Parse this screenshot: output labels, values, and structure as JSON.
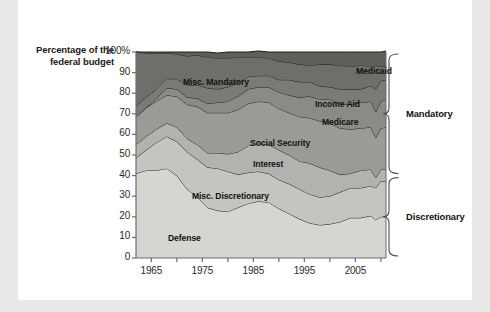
{
  "chart_data": {
    "type": "area",
    "title": "",
    "xlabel": "",
    "ylabel": "Percentage of the federal budget",
    "ylabel_line1": "Percentage of the",
    "ylabel_line2": "federal budget",
    "xlim": [
      1962,
      2011
    ],
    "ylim": [
      0,
      100
    ],
    "grid": false,
    "stacked": true,
    "legend_position": "inline-labels",
    "y_ticks": [
      "0",
      "10",
      "20",
      "30",
      "40",
      "50",
      "60",
      "70",
      "80",
      "90",
      "100%"
    ],
    "y_tick_values": [
      0,
      10,
      20,
      30,
      40,
      50,
      60,
      70,
      80,
      90,
      100
    ],
    "x_ticks": [
      "1965",
      "1975",
      "1985",
      "1995",
      "2005"
    ],
    "x_tick_values": [
      1965,
      1975,
      1985,
      1995,
      2005
    ],
    "x": [
      1962,
      1964,
      1966,
      1968,
      1970,
      1972,
      1974,
      1976,
      1978,
      1980,
      1982,
      1984,
      1986,
      1988,
      1990,
      1992,
      1994,
      1996,
      1998,
      2000,
      2002,
      2004,
      2006,
      2008,
      2009,
      2010,
      2011
    ],
    "series": [
      {
        "name": "Defense",
        "color": "#d5d5d2",
        "values": [
          41.0,
          42.5,
          42.5,
          43.5,
          40.0,
          33.5,
          29.5,
          24.5,
          23.0,
          22.5,
          24.5,
          26.5,
          27.5,
          27.0,
          24.0,
          21.5,
          19.0,
          17.0,
          16.0,
          16.5,
          17.5,
          19.5,
          19.5,
          20.5,
          18.5,
          20.0,
          20.0
        ]
      },
      {
        "name": "Misc. Discretionary",
        "color": "#c4c4c0",
        "values": [
          7.5,
          10.0,
          13.5,
          15.5,
          16.5,
          18.0,
          18.5,
          19.5,
          20.5,
          19.5,
          16.0,
          15.0,
          14.5,
          14.0,
          14.0,
          14.5,
          14.5,
          14.0,
          13.5,
          13.5,
          14.5,
          14.5,
          14.5,
          14.5,
          15.5,
          17.5,
          17.0
        ]
      },
      {
        "name": "Interest",
        "color": "#b2b2ae",
        "values": [
          6.5,
          6.5,
          6.5,
          6.5,
          7.0,
          6.5,
          7.0,
          7.0,
          7.5,
          8.5,
          11.0,
          13.0,
          13.5,
          14.0,
          14.5,
          14.0,
          13.5,
          15.0,
          14.5,
          12.5,
          8.5,
          7.0,
          8.5,
          8.0,
          5.0,
          5.5,
          6.0
        ]
      },
      {
        "name": "Social Security",
        "color": "#9a9a96",
        "values": [
          13.5,
          14.0,
          13.5,
          13.5,
          15.0,
          16.5,
          18.5,
          19.5,
          19.5,
          20.0,
          20.5,
          20.5,
          20.5,
          20.5,
          20.0,
          20.5,
          21.5,
          22.0,
          22.5,
          23.0,
          22.5,
          21.5,
          20.5,
          20.5,
          19.5,
          20.0,
          20.5
        ]
      },
      {
        "name": "Medicare",
        "color": "#8a8a86",
        "values": [
          0.0,
          0.0,
          1.5,
          3.5,
          3.5,
          3.5,
          4.0,
          4.5,
          5.0,
          5.5,
          6.5,
          7.0,
          7.0,
          7.5,
          8.0,
          8.5,
          9.5,
          10.5,
          10.5,
          11.5,
          12.0,
          12.0,
          12.5,
          12.5,
          12.5,
          13.0,
          13.5
        ]
      },
      {
        "name": "Income Aid",
        "color": "#7a7a76",
        "values": [
          5.5,
          5.0,
          4.5,
          4.5,
          5.0,
          6.0,
          6.5,
          7.5,
          6.5,
          7.0,
          6.5,
          6.0,
          5.5,
          5.5,
          6.0,
          7.5,
          7.5,
          7.0,
          6.5,
          6.0,
          7.0,
          7.5,
          6.5,
          7.5,
          11.0,
          10.0,
          9.5
        ]
      },
      {
        "name": "Misc. Mandatory",
        "color": "#6e6e6a",
        "values": [
          26.0,
          21.5,
          17.5,
          12.5,
          12.0,
          14.0,
          14.5,
          15.0,
          15.0,
          14.0,
          12.5,
          9.5,
          9.0,
          8.5,
          9.0,
          8.5,
          8.5,
          8.0,
          10.5,
          11.0,
          11.5,
          11.0,
          11.5,
          9.5,
          11.5,
          7.0,
          6.5
        ]
      },
      {
        "name": "Medicaid",
        "color": "#5e5e5a",
        "values": [
          0.0,
          0.5,
          0.5,
          0.5,
          1.0,
          2.0,
          1.5,
          2.5,
          2.5,
          3.0,
          2.5,
          2.5,
          3.0,
          3.0,
          4.5,
          5.0,
          6.0,
          6.5,
          6.0,
          6.0,
          6.5,
          7.0,
          6.5,
          7.0,
          6.5,
          7.0,
          7.5
        ]
      }
    ],
    "band_labels": [
      {
        "name": "Medicaid",
        "x": 356,
        "y": 66
      },
      {
        "name": "Misc. Mandatory",
        "x": 183,
        "y": 77
      },
      {
        "name": "Income Aid",
        "x": 315,
        "y": 99
      },
      {
        "name": "Medicare",
        "x": 322,
        "y": 117
      },
      {
        "name": "Social Security",
        "x": 250,
        "y": 138
      },
      {
        "name": "Interest",
        "x": 253,
        "y": 159
      },
      {
        "name": "Misc. Discretionary",
        "x": 192,
        "y": 191
      },
      {
        "name": "Defense",
        "x": 168,
        "y": 233
      }
    ],
    "group_braces": [
      {
        "label": "Mandatory",
        "top_pct": 40,
        "bottom_pct": 100
      },
      {
        "label": "Discretionary",
        "top_pct": 0,
        "bottom_pct": 40
      }
    ],
    "colors": {
      "axis": "#6d6d6d",
      "stroke": "#1d1d1d",
      "text": "#1a1a1a",
      "card": "#ffffff",
      "page": "#e9e9e9"
    }
  }
}
